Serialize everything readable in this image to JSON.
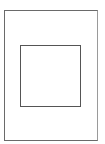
{
  "diagram": {
    "shapes": [
      {
        "id": "outer",
        "type": "rectangle",
        "stroke": "#6a6a6a",
        "fill": "#ffffff"
      },
      {
        "id": "inner",
        "type": "square",
        "stroke": "#555555",
        "fill": "#ffffff"
      }
    ]
  }
}
